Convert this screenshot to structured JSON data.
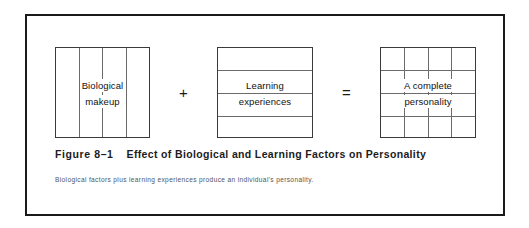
{
  "figure": {
    "number_label": "Figure 8–1",
    "title": "Effect of Biological and Learning Factors on Personality",
    "description": "Biological factors plus learning experiences produce an individual's personality.",
    "frame_color": "#1a1a1a",
    "box_border_color": "#3a3a3a",
    "grid_line_color": "#6b6b6b"
  },
  "diagram": {
    "boxes": [
      {
        "name": "biological-makeup",
        "label_line1": "Biological",
        "label_line2": "makeup",
        "grid": {
          "columns": 4,
          "rows": 1
        }
      },
      {
        "name": "learning-experiences",
        "label_line1": "Learning",
        "label_line2": "experiences",
        "grid": {
          "columns": 1,
          "rows": 4
        }
      },
      {
        "name": "complete-personality",
        "label_line1": "A complete",
        "label_line2": "personality",
        "grid": {
          "columns": 4,
          "rows": 4
        }
      }
    ],
    "operators": [
      {
        "name": "plus",
        "symbol": "+"
      },
      {
        "name": "equals",
        "symbol": "="
      }
    ]
  }
}
